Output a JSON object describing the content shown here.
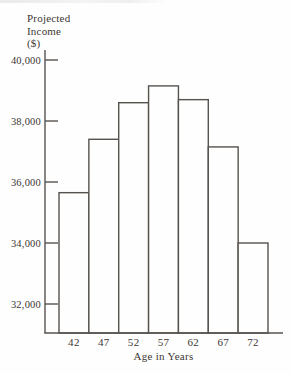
{
  "figure": {
    "background": "#fefefe",
    "line_color": "#56524e",
    "text_color": "#3c3733",
    "bar_fill": "#fefefe",
    "y_axis_title": "Projected\nIncome\n($)"
  },
  "chart_data": {
    "type": "bar",
    "xlabel": "Age in Years",
    "ylabel": "Projected Income ($)",
    "categories": [
      "42",
      "47",
      "52",
      "57",
      "62",
      "67",
      "72"
    ],
    "values": [
      35650,
      37400,
      38600,
      39150,
      38700,
      37150,
      34000
    ],
    "y_ticks": [
      40000,
      38000,
      36000,
      34000,
      32000
    ],
    "y_tick_labels": [
      "40,000",
      "38,000",
      "36,000",
      "34,000",
      "32,000"
    ],
    "ylim": [
      31050,
      40350
    ],
    "grid": false,
    "legend": "none",
    "bar_style": "contiguous outlined white bars"
  }
}
